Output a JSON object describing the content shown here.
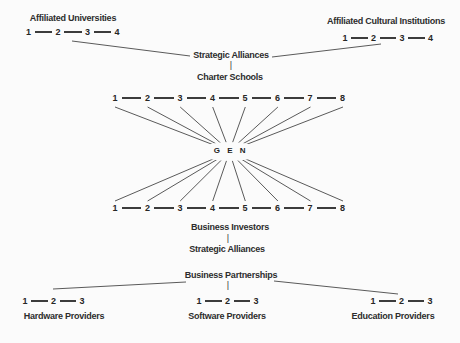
{
  "diagram": {
    "center_label": "G E N",
    "colors": {
      "line": "#5a5a5a",
      "text": "#2d2d2d",
      "background": "#fbfbfb"
    },
    "groups": {
      "affiliated_universities": {
        "label": "Affiliated Universities",
        "nodes": [
          "1",
          "2",
          "3",
          "4"
        ]
      },
      "affiliated_cultural_institutions": {
        "label": "Affiliated Cultural Institutions",
        "nodes": [
          "1",
          "2",
          "3",
          "4"
        ]
      },
      "upper_hub": {
        "line1": "Strategic Alliances",
        "separator": "|",
        "line2": "Charter Schools"
      },
      "upper_network_row": {
        "nodes": [
          "1",
          "2",
          "3",
          "4",
          "5",
          "6",
          "7",
          "8"
        ]
      },
      "lower_network_row": {
        "nodes": [
          "1",
          "2",
          "3",
          "4",
          "5",
          "6",
          "7",
          "8"
        ]
      },
      "lower_hub": {
        "line1": "Business Investors",
        "separator": "|",
        "line2": "Strategic Alliances"
      },
      "partnerships_hub": {
        "label": "Business Partnerships",
        "separator": "|"
      },
      "hardware_providers": {
        "label": "Hardware Providers",
        "nodes": [
          "1",
          "2",
          "3"
        ]
      },
      "software_providers": {
        "label": "Software Providers",
        "nodes": [
          "1",
          "2",
          "3"
        ]
      },
      "education_providers": {
        "label": "Education Providers",
        "nodes": [
          "1",
          "2",
          "3"
        ]
      }
    }
  }
}
